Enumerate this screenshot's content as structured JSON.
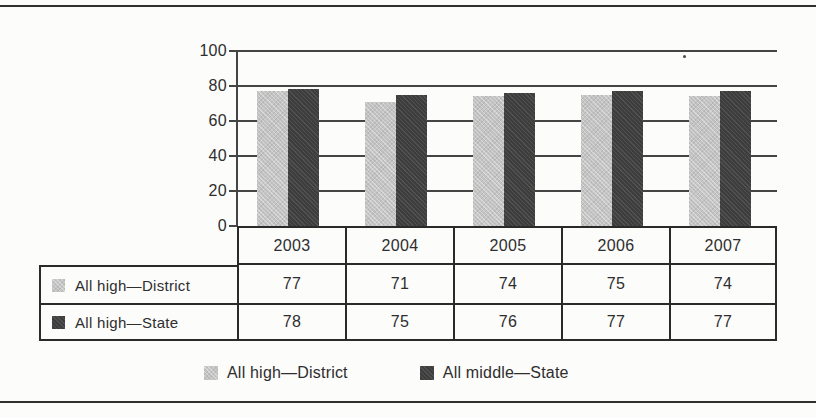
{
  "chart_data": {
    "type": "bar",
    "title": "",
    "xlabel": "",
    "ylabel": "",
    "categories": [
      "2003",
      "2004",
      "2005",
      "2006",
      "2007"
    ],
    "series": [
      {
        "name": "All high—District",
        "color": "#c4c4c4",
        "values": [
          77,
          71,
          74,
          75,
          74
        ]
      },
      {
        "name": "All high—State",
        "color": "#3d3d3d",
        "values": [
          78,
          75,
          76,
          77,
          77
        ]
      }
    ],
    "ylim": [
      0,
      100
    ],
    "yticks": [
      0,
      20,
      40,
      60,
      80,
      100
    ],
    "grid": true,
    "legend_position": "bottom"
  },
  "table": {
    "header": [
      "2003",
      "2004",
      "2005",
      "2006",
      "2007"
    ],
    "rows": [
      {
        "label": "All high—District",
        "swatch": "series0",
        "values": [
          "77",
          "71",
          "74",
          "75",
          "74"
        ]
      },
      {
        "label": "All high—State",
        "swatch": "series1",
        "values": [
          "78",
          "75",
          "76",
          "77",
          "77"
        ]
      }
    ]
  },
  "legend": {
    "items": [
      {
        "label": "All high—District",
        "swatch": "series0"
      },
      {
        "label": "All middle—State",
        "swatch": "series1"
      }
    ]
  },
  "colors": {
    "border": "#2a2a2a",
    "axis": "#454545",
    "light_series": "#c4c4c4",
    "dark_series": "#3d3d3d"
  }
}
